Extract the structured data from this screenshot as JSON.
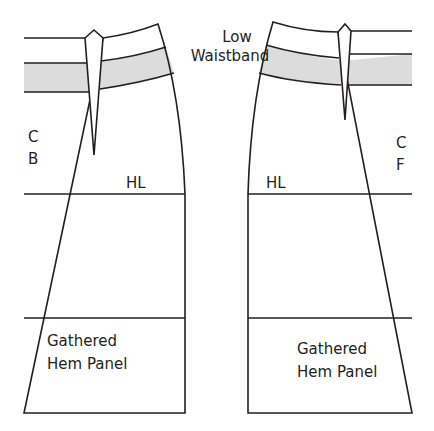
{
  "diagram": {
    "title_label": {
      "line1": "Low",
      "line2": "Waistband"
    },
    "back_panel": {
      "center_label": {
        "line1": "C",
        "line2": "B"
      },
      "hip_line_label": "HL",
      "hem_label": {
        "line1": "Gathered",
        "line2": "Hem Panel"
      }
    },
    "front_panel": {
      "center_label": {
        "line1": "C",
        "line2": "F"
      },
      "hip_line_label": "HL",
      "hem_label": {
        "line1": "Gathered",
        "line2": "Hem Panel"
      }
    },
    "colors": {
      "stroke": "#231f20",
      "waistband_fill": "#dcdcdc"
    }
  }
}
